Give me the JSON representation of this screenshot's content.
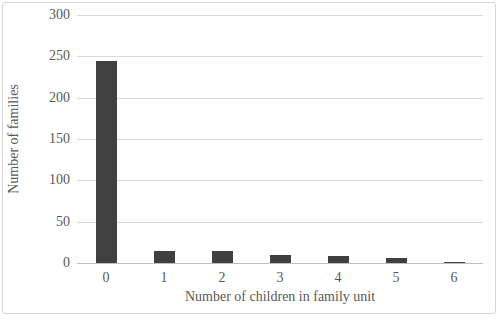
{
  "chart_data": {
    "type": "bar",
    "title": "",
    "xlabel": "Number of children in family unit",
    "ylabel": "Number of families",
    "categories": [
      "0",
      "1",
      "2",
      "3",
      "4",
      "5",
      "6"
    ],
    "values": [
      245,
      15,
      15,
      10,
      9,
      6,
      1
    ],
    "yticks": [
      0,
      50,
      100,
      150,
      200,
      250,
      300
    ],
    "ylim": [
      0,
      300
    ],
    "grid": true,
    "legend": "none",
    "bar_color": "#404040",
    "gridline_color": "#d9d9d9",
    "axis_color": "#bfbfbf",
    "text_color": "#595959",
    "frame_border_color": "#d6d6d6",
    "background_color": "#ffffff"
  }
}
